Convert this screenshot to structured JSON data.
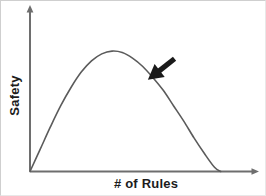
{
  "figure": {
    "background_color": "#ffffff",
    "line_color": "#5b5b5b",
    "axis_color": "#6e6e6e",
    "text_color": "#1c1c1c",
    "annotation_color": "#1a1a1a"
  },
  "chart_data": {
    "type": "line",
    "title": "",
    "xlabel": "# of Rules",
    "ylabel": "Safety",
    "xlim": [
      0,
      10
    ],
    "ylim": [
      0,
      10
    ],
    "grid": false,
    "legend": null,
    "axis_ticks": {
      "x": [],
      "y": []
    },
    "axis_arrows": {
      "x": "right",
      "y": "up"
    },
    "series": [
      {
        "name": "Safety vs number of rules",
        "comment": "inverted-U / concave curve: safety rises with rules, peaks, then falls",
        "x": [
          0.0,
          0.5,
          1.0,
          1.5,
          2.0,
          2.5,
          3.0,
          3.5,
          4.0,
          4.5,
          5.0,
          5.5,
          6.0,
          6.5,
          7.0,
          7.5,
          8.0,
          8.5,
          9.0,
          9.3
        ],
        "y": [
          0.0,
          1.6,
          3.2,
          4.7,
          6.0,
          7.1,
          7.9,
          8.4,
          8.6,
          8.5,
          8.1,
          7.5,
          6.7,
          5.8,
          4.7,
          3.6,
          2.4,
          1.3,
          0.3,
          0.0
        ]
      }
    ],
    "annotations": [
      {
        "name": "descending-limb-arrow",
        "type": "arrow",
        "label": "",
        "tail": [
          7.05,
          8.05
        ],
        "head": [
          5.75,
          6.55
        ],
        "direction": "down-left",
        "color": "#1a1a1a"
      }
    ]
  }
}
